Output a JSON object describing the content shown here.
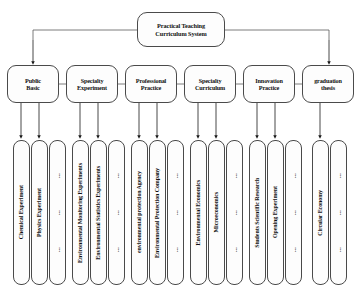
{
  "diagram": {
    "title": "Practical Teaching Curriculum System",
    "type": "hierarchical-tree",
    "root": {
      "line1": "Practical Teaching",
      "line2": "Curriculum System"
    },
    "ellipsis_mark": "...",
    "branches": [
      {
        "id": "public-basic",
        "line1": "Public",
        "line2": "Basic",
        "children": [
          "Chemical Experiment",
          "Physics Experiment",
          "..."
        ]
      },
      {
        "id": "specialty-experiment",
        "line1": "Specialty",
        "line2": "Experiment",
        "children": [
          "Environmental Monitoring Experiments",
          "Environmental Statistics Experiments",
          "..."
        ]
      },
      {
        "id": "professional-practice",
        "line1": "Professional",
        "line2": "Practice",
        "children": [
          "environmental protection Agency",
          "Environmental Protection Company",
          "..."
        ]
      },
      {
        "id": "specialty-curriculum",
        "line1": "Specialty",
        "line2": "Curriculum",
        "children": [
          "Environmental Economics",
          "Microeconomics",
          "..."
        ]
      },
      {
        "id": "innovation-practice",
        "line1": "Innovation",
        "line2": "Practice",
        "children": [
          "Students Scientific Research",
          "Opening Experiment",
          "..."
        ]
      },
      {
        "id": "graduation-thesis",
        "line1": "graduation",
        "line2": "thesis",
        "children": [
          "Circular Economy",
          "..."
        ]
      }
    ]
  },
  "colors": {
    "stroke": "#4a4a4a",
    "arrow": "#1a1a1a",
    "box_fill": "#fdfdfd",
    "background": "#ffffff",
    "text": "#111111"
  }
}
